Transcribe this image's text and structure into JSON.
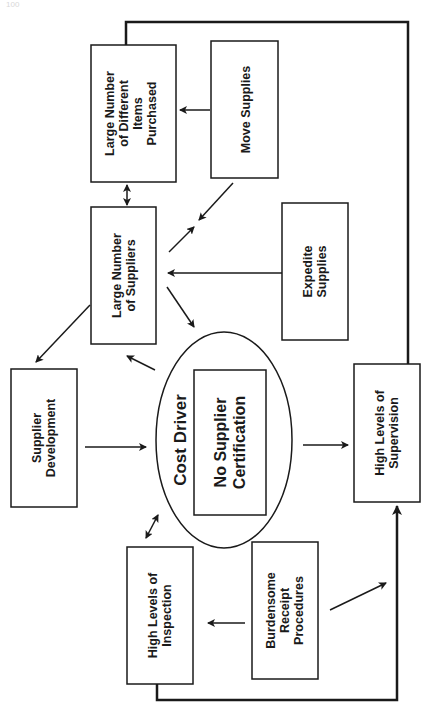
{
  "page": {
    "number": "100"
  },
  "diagram": {
    "title": "Cost Driver",
    "colors": {
      "stroke": "#1a1a1a",
      "background": "#ffffff"
    },
    "center": {
      "label": "Cost Driver",
      "driver_lines": [
        "No Supplier",
        "Certification"
      ]
    },
    "nodes": {
      "items_purchased": {
        "lines": [
          "Large Number",
          "of Different",
          "Items",
          "Purchased"
        ]
      },
      "move_supplies": {
        "lines": [
          "Move Supplies"
        ]
      },
      "large_suppliers": {
        "lines": [
          "Large Number",
          "of Suppliers"
        ]
      },
      "expedite": {
        "lines": [
          "Expedite",
          "Supplies"
        ]
      },
      "supplier_dev": {
        "lines": [
          "Supplier",
          "Development"
        ]
      },
      "supervision": {
        "lines": [
          "High Levels of",
          "Supervision"
        ]
      },
      "inspection": {
        "lines": [
          "High Levels of",
          "Inspection"
        ]
      },
      "receipt": {
        "lines": [
          "Burdensome",
          "Receipt",
          "Procedures"
        ]
      }
    },
    "edges": [
      {
        "from": "move_supplies",
        "to": "items_purchased"
      },
      {
        "from": "items_purchased",
        "to": "large_suppliers",
        "bidirectional": true
      },
      {
        "from": "move_supplies",
        "to": "large_suppliers"
      },
      {
        "from": "large_suppliers",
        "to": "move_supplies"
      },
      {
        "from": "expedite",
        "to": "large_suppliers"
      },
      {
        "from": "large_suppliers",
        "to": "supplier_dev"
      },
      {
        "from": "large_suppliers",
        "to": "center"
      },
      {
        "from": "center",
        "to": "large_suppliers"
      },
      {
        "from": "supplier_dev",
        "to": "center"
      },
      {
        "from": "center",
        "to": "supervision"
      },
      {
        "from": "center",
        "to": "inspection",
        "bidirectional": true
      },
      {
        "from": "receipt",
        "to": "inspection"
      },
      {
        "from": "receipt",
        "to": "supervision"
      },
      {
        "from": "items_purchased",
        "to": "supervision",
        "style": "thick"
      },
      {
        "from": "inspection",
        "to": "supervision",
        "style": "thick"
      }
    ]
  }
}
